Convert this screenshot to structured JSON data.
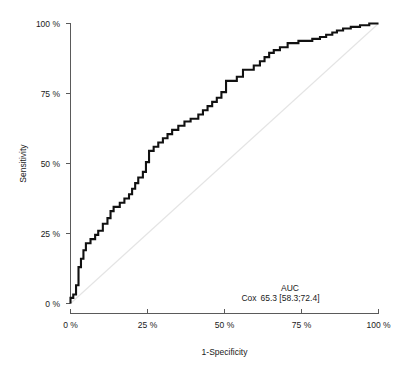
{
  "chart_data": {
    "type": "line",
    "title": "",
    "xlabel": "1-Specificity",
    "ylabel": "Sensitivity",
    "xlim": [
      0,
      100
    ],
    "ylim": [
      0,
      100
    ],
    "grid": false,
    "x_tick_labels": [
      "0 %",
      "25 %",
      "50 %",
      "75 %",
      "100 %"
    ],
    "x_tick_values": [
      0,
      25,
      50,
      75,
      100
    ],
    "y_tick_labels": [
      "0 %",
      "25 %",
      "50 %",
      "75 %",
      "100 %"
    ],
    "y_tick_values": [
      0,
      25,
      50,
      75,
      100
    ],
    "series": [
      {
        "name": "Cox",
        "kind": "roc-step-curve",
        "color": "#111111",
        "points": [
          [
            0.0,
            0.0
          ],
          [
            0.0,
            2.0
          ],
          [
            0.9,
            2.0
          ],
          [
            0.9,
            3.2
          ],
          [
            1.8,
            3.2
          ],
          [
            1.8,
            6.5
          ],
          [
            2.6,
            6.5
          ],
          [
            2.6,
            9.5
          ],
          [
            2.6,
            13.0
          ],
          [
            3.4,
            13.0
          ],
          [
            3.4,
            16.0
          ],
          [
            4.2,
            16.0
          ],
          [
            4.2,
            19.0
          ],
          [
            5.0,
            19.0
          ],
          [
            5.0,
            21.5
          ],
          [
            6.5,
            21.5
          ],
          [
            6.5,
            23.0
          ],
          [
            8.0,
            23.0
          ],
          [
            8.0,
            24.5
          ],
          [
            9.0,
            24.5
          ],
          [
            9.0,
            26.0
          ],
          [
            10.5,
            26.0
          ],
          [
            10.5,
            28.5
          ],
          [
            12.0,
            28.5
          ],
          [
            12.0,
            30.5
          ],
          [
            13.0,
            30.5
          ],
          [
            13.0,
            33.0
          ],
          [
            14.0,
            33.0
          ],
          [
            14.0,
            34.5
          ],
          [
            16.0,
            34.5
          ],
          [
            16.0,
            36.0
          ],
          [
            17.5,
            36.0
          ],
          [
            17.5,
            37.5
          ],
          [
            19.0,
            37.5
          ],
          [
            19.0,
            39.0
          ],
          [
            20.0,
            39.0
          ],
          [
            20.0,
            41.0
          ],
          [
            21.0,
            41.0
          ],
          [
            21.0,
            43.0
          ],
          [
            22.0,
            43.0
          ],
          [
            22.0,
            45.0
          ],
          [
            23.5,
            45.0
          ],
          [
            23.5,
            47.0
          ],
          [
            24.5,
            47.0
          ],
          [
            24.5,
            50.5
          ],
          [
            25.5,
            50.5
          ],
          [
            25.5,
            54.5
          ],
          [
            27.0,
            54.5
          ],
          [
            27.0,
            56.0
          ],
          [
            28.5,
            56.0
          ],
          [
            28.5,
            57.5
          ],
          [
            30.0,
            57.5
          ],
          [
            30.0,
            59.0
          ],
          [
            31.5,
            59.0
          ],
          [
            31.5,
            60.5
          ],
          [
            33.0,
            60.5
          ],
          [
            33.0,
            62.0
          ],
          [
            35.0,
            62.0
          ],
          [
            35.0,
            63.5
          ],
          [
            37.0,
            63.5
          ],
          [
            37.0,
            65.0
          ],
          [
            39.0,
            65.0
          ],
          [
            39.0,
            66.0
          ],
          [
            41.5,
            66.0
          ],
          [
            41.5,
            67.5
          ],
          [
            43.0,
            67.5
          ],
          [
            43.0,
            69.0
          ],
          [
            44.5,
            69.0
          ],
          [
            44.5,
            70.5
          ],
          [
            46.0,
            70.5
          ],
          [
            46.0,
            72.0
          ],
          [
            47.5,
            72.0
          ],
          [
            47.5,
            73.5
          ],
          [
            49.0,
            73.5
          ],
          [
            49.0,
            75.5
          ],
          [
            50.5,
            75.5
          ],
          [
            50.5,
            79.5
          ],
          [
            54.0,
            79.5
          ],
          [
            54.0,
            81.0
          ],
          [
            56.0,
            81.0
          ],
          [
            56.0,
            83.5
          ],
          [
            59.5,
            83.5
          ],
          [
            59.5,
            85.0
          ],
          [
            61.5,
            85.0
          ],
          [
            61.5,
            86.5
          ],
          [
            63.0,
            86.5
          ],
          [
            63.0,
            88.0
          ],
          [
            64.5,
            88.0
          ],
          [
            64.5,
            89.5
          ],
          [
            66.0,
            89.5
          ],
          [
            66.0,
            90.5
          ],
          [
            68.0,
            90.5
          ],
          [
            68.0,
            91.5
          ],
          [
            70.5,
            91.5
          ],
          [
            70.5,
            93.0
          ],
          [
            74.0,
            93.0
          ],
          [
            74.0,
            93.8
          ],
          [
            78.5,
            93.8
          ],
          [
            78.5,
            94.5
          ],
          [
            81.0,
            94.5
          ],
          [
            81.0,
            95.2
          ],
          [
            83.0,
            95.2
          ],
          [
            83.0,
            96.0
          ],
          [
            85.0,
            96.0
          ],
          [
            85.0,
            96.8
          ],
          [
            86.5,
            96.8
          ],
          [
            86.5,
            97.5
          ],
          [
            88.5,
            97.5
          ],
          [
            88.5,
            98.2
          ],
          [
            91.0,
            98.2
          ],
          [
            91.0,
            98.8
          ],
          [
            94.0,
            98.8
          ],
          [
            94.0,
            99.4
          ],
          [
            97.0,
            99.4
          ],
          [
            97.0,
            100.0
          ],
          [
            100.0,
            100.0
          ]
        ]
      },
      {
        "name": "reference-diagonal",
        "kind": "reference",
        "color": "#e4e4e4",
        "points": [
          [
            0,
            0
          ],
          [
            100,
            100
          ]
        ]
      }
    ],
    "annotations": {
      "auc_header": "AUC",
      "rows": [
        {
          "model": "Cox",
          "value": "65.3 [58.3;72.4]"
        }
      ]
    }
  }
}
